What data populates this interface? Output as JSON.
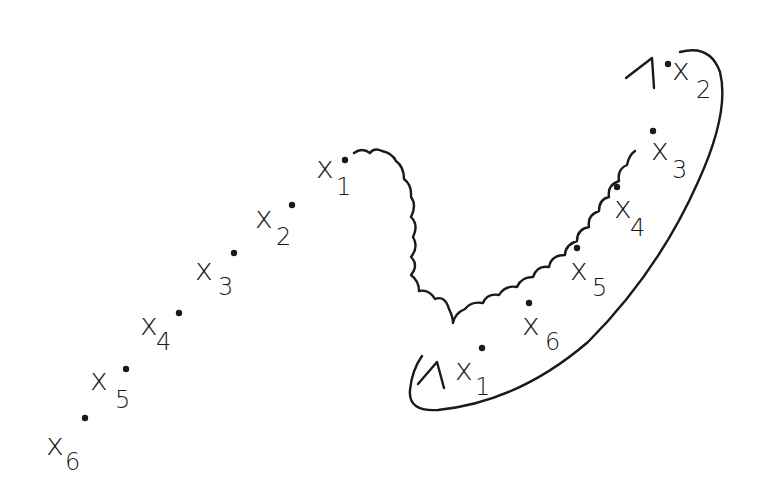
{
  "diagram": {
    "left_sequence": {
      "points": [
        {
          "label": "x",
          "sub": "1",
          "dot": [
            345,
            160
          ],
          "x": 316,
          "y": 178,
          "sx": 336,
          "sy": 195
        },
        {
          "label": "x",
          "sub": "2",
          "dot": [
            292,
            205
          ],
          "x": 255,
          "y": 228,
          "sx": 276,
          "sy": 245
        },
        {
          "label": "x",
          "sub": "3",
          "dot": [
            234,
            253
          ],
          "x": 195,
          "y": 280,
          "sx": 218,
          "sy": 295
        },
        {
          "label": "x",
          "sub": "4",
          "dot": [
            179,
            313
          ],
          "x": 140,
          "y": 335,
          "sx": 156,
          "sy": 350
        },
        {
          "label": "x",
          "sub": "5",
          "dot": [
            126,
            369
          ],
          "x": 90,
          "y": 390,
          "sx": 115,
          "sy": 408
        },
        {
          "label": "x",
          "sub": "6",
          "dot": [
            85,
            418
          ],
          "x": 46,
          "y": 455,
          "sx": 65,
          "sy": 470
        }
      ]
    },
    "right_sequence": {
      "points": [
        {
          "label": "x",
          "sub": "1",
          "dot": [
            482,
            348
          ],
          "x": 455,
          "y": 380,
          "sx": 475,
          "sy": 395
        },
        {
          "label": "x",
          "sub": "2",
          "dot": [
            668,
            64
          ],
          "x": 672,
          "y": 80,
          "sx": 696,
          "sy": 98
        },
        {
          "label": "x",
          "sub": "3",
          "dot": [
            653,
            131
          ],
          "x": 651,
          "y": 160,
          "sx": 672,
          "sy": 178
        },
        {
          "label": "x",
          "sub": "4",
          "dot": [
            617,
            187
          ],
          "x": 614,
          "y": 218,
          "sx": 630,
          "sy": 236
        },
        {
          "label": "x",
          "sub": "5",
          "dot": [
            577,
            248
          ],
          "x": 570,
          "y": 280,
          "sx": 592,
          "sy": 296
        },
        {
          "label": "x",
          "sub": "6",
          "dot": [
            529,
            303
          ],
          "x": 522,
          "y": 335,
          "sx": 545,
          "sy": 350
        }
      ]
    },
    "connectors": [
      "wavy-path",
      "loop-arrow"
    ]
  }
}
